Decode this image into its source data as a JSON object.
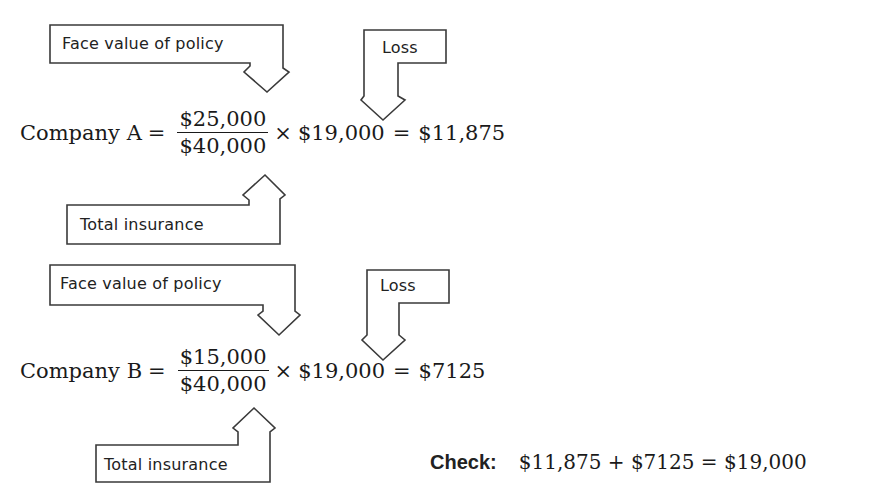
{
  "callouts": {
    "face_value_label": "Face value of policy",
    "loss_label": "Loss",
    "total_insurance_label": "Total insurance"
  },
  "company_a": {
    "name": "Company A",
    "equals": "=",
    "numerator": "$25,000",
    "denominator": "$40,000",
    "times": "×",
    "loss": "$19,000",
    "equals2": "=",
    "result": "$11,875"
  },
  "company_b": {
    "name": "Company B",
    "equals": "=",
    "numerator": "$15,000",
    "denominator": "$40,000",
    "times": "×",
    "loss": "$19,000",
    "equals2": "=",
    "result": "$7125"
  },
  "check": {
    "label": "Check:",
    "expression": "$11,875 + $7125 = $19,000"
  }
}
